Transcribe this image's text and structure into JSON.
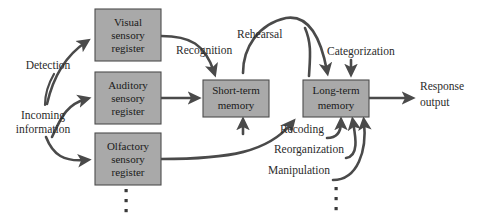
{
  "diagram": {
    "colors": {
      "box_fill": "#a9a9a9",
      "box_stroke": "#4d4d4d",
      "arrow": "#4a4a4a",
      "text": "#1a1a1a",
      "background": "#ffffff"
    },
    "boxes": [
      {
        "id": "visual-sensory-register",
        "lines": [
          "Visual",
          "sensory",
          "register"
        ],
        "x": 95,
        "y": 9,
        "w": 66,
        "h": 52
      },
      {
        "id": "auditory-sensory-register",
        "lines": [
          "Auditory",
          "sensory",
          "register"
        ],
        "x": 95,
        "y": 72,
        "w": 66,
        "h": 52
      },
      {
        "id": "olfactory-sensory-register",
        "lines": [
          "Olfactory",
          "sensory",
          "register"
        ],
        "x": 95,
        "y": 133,
        "w": 66,
        "h": 52
      },
      {
        "id": "short-term-memory",
        "lines": [
          "Short-term",
          "memory"
        ],
        "x": 203,
        "y": 80,
        "w": 66,
        "h": 37
      },
      {
        "id": "long-term-memory",
        "lines": [
          "Long-term",
          "memory"
        ],
        "x": 303,
        "y": 80,
        "w": 66,
        "h": 37
      }
    ],
    "labels": [
      {
        "id": "detection",
        "text": "Detection",
        "x": 48,
        "y": 66
      },
      {
        "id": "incoming-information-line1",
        "text": "Incoming",
        "x": 43,
        "y": 116
      },
      {
        "id": "incoming-information-line2",
        "text": "information",
        "x": 43,
        "y": 130
      },
      {
        "id": "recognition",
        "text": "Recognition",
        "x": 176,
        "y": 51
      },
      {
        "id": "rehearsal",
        "text": "Rehearsal",
        "x": 237,
        "y": 35
      },
      {
        "id": "categorization",
        "text": "Categorization",
        "x": 327,
        "y": 52
      },
      {
        "id": "response-output-line1",
        "text": "Response",
        "x": 420,
        "y": 87
      },
      {
        "id": "response-output-line2",
        "text": "output",
        "x": 420,
        "y": 103
      },
      {
        "id": "recoding",
        "text": "Recoding",
        "x": 324,
        "y": 130
      },
      {
        "id": "reorganization",
        "text": "Reorganization",
        "x": 344,
        "y": 150
      },
      {
        "id": "manipulation",
        "text": "Manipulation",
        "x": 330,
        "y": 171
      }
    ],
    "ellipses": [
      {
        "id": "sensory-register-ellipsis",
        "x": 127,
        "ys": [
          191,
          201,
          211
        ]
      },
      {
        "id": "ltm-input-ellipsis",
        "x": 336,
        "ys": [
          189,
          199,
          209
        ]
      }
    ]
  }
}
